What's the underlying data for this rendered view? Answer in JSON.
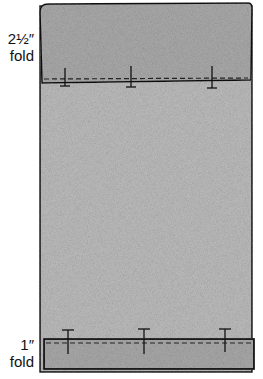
{
  "labels": {
    "top_measure": "2½″",
    "top_word": "fold",
    "bottom_measure": "1″",
    "bottom_word": "fold"
  },
  "colors": {
    "fabric": "#b9b9b9",
    "fold": "#a9a9a9",
    "outline": "#111111"
  }
}
